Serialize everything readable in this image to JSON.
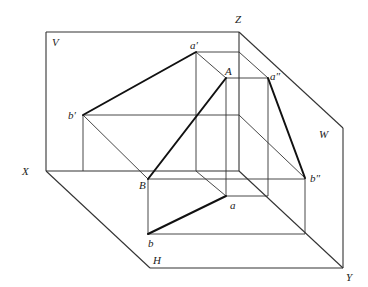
{
  "diagram": {
    "type": "three-view projection of line segment AB",
    "planes": {
      "V": "V",
      "H": "H",
      "W": "W"
    },
    "axes": {
      "X": "X",
      "Y": "Y",
      "Z": "Z"
    },
    "points": {
      "A": "A",
      "B": "B",
      "a": "a",
      "b": "b",
      "a_prime": "a′",
      "b_prime": "b′",
      "a_double_prime": "a″",
      "b_double_prime": "b″"
    },
    "colors": {
      "line": "#333333",
      "bold_line": "#111111",
      "background": "#ffffff"
    }
  }
}
